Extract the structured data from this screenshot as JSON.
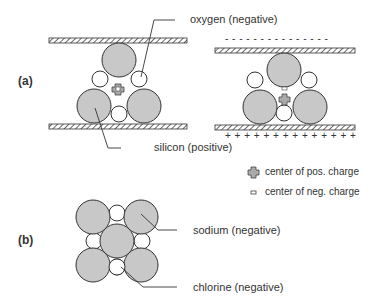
{
  "figure": {
    "parts": [
      {
        "id": "a",
        "label": "(a)"
      },
      {
        "id": "b",
        "label": "(b)"
      }
    ],
    "labels": {
      "oxygen": "oxygen (negative)",
      "silicon": "silicon (positive)",
      "sodium": "sodium (negative)",
      "chlorine": "chlorine (negative)"
    },
    "legend": {
      "pos_charge": "center of pos. charge",
      "neg_charge": "center of neg. charge"
    },
    "charges": {
      "top_plate": "- - - - - - - - - - - - - - -",
      "bottom_plate": "+ + + + + + + + + + + + + +"
    },
    "colors": {
      "large_atom": "#c8c8c8",
      "small_atom": "#ffffff",
      "stroke": "#333333"
    }
  }
}
